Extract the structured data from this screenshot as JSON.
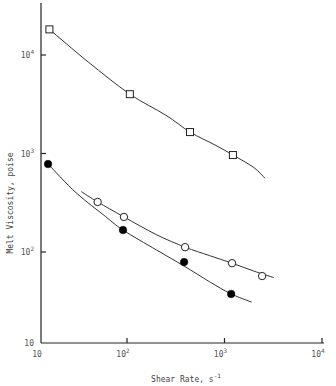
{
  "chart_data": {
    "type": "scatter",
    "title": "",
    "xlabel": "Shear Rate, s",
    "xlabel_sup": "-1",
    "ylabel": "Melt Viscosity, poise",
    "xscale": "log",
    "yscale": "log",
    "xlim": [
      12,
      10000
    ],
    "ylim": [
      10,
      30000
    ],
    "grid": false,
    "legend": null,
    "x_ticks": [
      {
        "value": 10,
        "base": "10",
        "exp": ""
      },
      {
        "value": 100,
        "base": "10",
        "exp": "2"
      },
      {
        "value": 1000,
        "base": "10",
        "exp": "3"
      },
      {
        "value": 10000,
        "base": "10",
        "exp": "4"
      }
    ],
    "y_ticks": [
      {
        "value": 10,
        "base": "10",
        "exp": ""
      },
      {
        "value": 100,
        "base": "10",
        "exp": "2"
      },
      {
        "value": 1000,
        "base": "10",
        "exp": "3"
      },
      {
        "value": 10000,
        "base": "10",
        "exp": "4"
      }
    ],
    "series": [
      {
        "name": "open squares",
        "marker": "square-open",
        "x": [
          16,
          107,
          443,
          1220
        ],
        "y": [
          18200,
          4000,
          1650,
          965
        ],
        "curve_x": [
          16,
          40,
          107,
          250,
          443,
          800,
          1220,
          2000,
          2600
        ],
        "curve_y": [
          18200,
          8500,
          4000,
          2450,
          1650,
          1220,
          965,
          720,
          560
        ]
      },
      {
        "name": "open circles",
        "marker": "circle-open",
        "x": [
          50,
          93,
          394,
          1195,
          2430
        ],
        "y": [
          322,
          227,
          112,
          77,
          57
        ],
        "curve_x": [
          34,
          50,
          93,
          200,
          394,
          700,
          1195,
          2000,
          3200
        ],
        "curve_y": [
          410,
          322,
          227,
          150,
          112,
          92,
          77,
          64,
          55
        ]
      },
      {
        "name": "filled circles",
        "marker": "circle-filled",
        "x": [
          15.5,
          91,
          385,
          1170
        ],
        "y": [
          781,
          167,
          79,
          37.5
        ],
        "curve_x": [
          15.5,
          30,
          60,
          91,
          200,
          385,
          700,
          1170,
          1900
        ],
        "curve_y": [
          781,
          400,
          230,
          167,
          105,
          72,
          50,
          37.5,
          31
        ]
      }
    ]
  }
}
